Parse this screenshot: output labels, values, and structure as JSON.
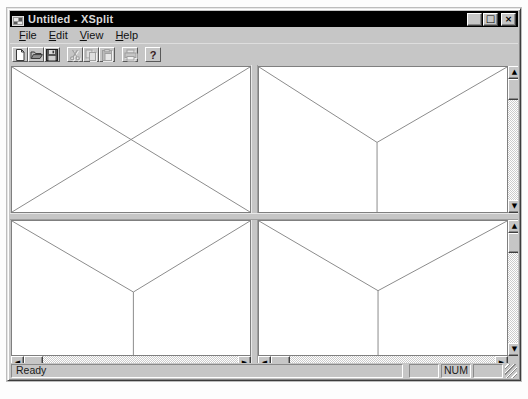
{
  "window": {
    "title": "Untitled - XSplit"
  },
  "titlebar": {
    "minimize_glyph": "_",
    "maximize_glyph": "□",
    "close_glyph": "×"
  },
  "menu": {
    "items": [
      {
        "key": "F",
        "rest": "ile"
      },
      {
        "key": "E",
        "rest": "dit"
      },
      {
        "key": "V",
        "rest": "iew"
      },
      {
        "key": "H",
        "rest": "elp"
      }
    ]
  },
  "toolbar": {
    "buttons": [
      {
        "icon": "new-document-icon",
        "enabled": true
      },
      {
        "icon": "open-folder-icon",
        "enabled": true
      },
      {
        "icon": "save-floppy-icon",
        "enabled": true
      },
      {
        "icon": "cut-scissors-icon",
        "enabled": false
      },
      {
        "icon": "copy-pages-icon",
        "enabled": false
      },
      {
        "icon": "paste-clipboard-icon",
        "enabled": false
      },
      {
        "icon": "print-icon",
        "enabled": false
      },
      {
        "icon": "help-question-icon",
        "enabled": true
      }
    ],
    "help_glyph": "?"
  },
  "panes": {
    "top_left": {
      "lines": [
        [
          0,
          0,
          100,
          100
        ],
        [
          100,
          0,
          0,
          100
        ]
      ]
    },
    "top_right": {
      "lines": [
        [
          0,
          0,
          47.6,
          52
        ],
        [
          100,
          0,
          47.6,
          52
        ],
        [
          47.6,
          52,
          47.6,
          100
        ]
      ]
    },
    "bottom_left": {
      "lines": [
        [
          0,
          0,
          51,
          53
        ],
        [
          100,
          0,
          51,
          53
        ],
        [
          51,
          53,
          51,
          100
        ]
      ]
    },
    "bottom_right": {
      "lines": [
        [
          0,
          0,
          48,
          52
        ],
        [
          100,
          0,
          48,
          52
        ],
        [
          48,
          52,
          48,
          100
        ]
      ]
    }
  },
  "scrollbars": {
    "up_glyph": "▲",
    "down_glyph": "▼",
    "left_glyph": "◄",
    "right_glyph": "►"
  },
  "statusbar": {
    "message": "Ready",
    "indicators": [
      "",
      "NUM",
      ""
    ]
  },
  "colors": {
    "titlebar_bg": "#000000",
    "chrome": "#c6c6c6",
    "pane_line": "#8c8c8c"
  }
}
